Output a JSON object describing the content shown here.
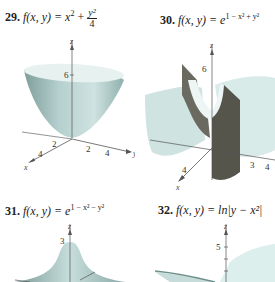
{
  "problems": [
    {
      "number": "29.",
      "lhs": "f(x, y) = ",
      "expr_main": "x",
      "expr_main_sup": "2",
      "expr_plus": " + ",
      "frac_num": "y²",
      "frac_den": "4",
      "axis": {
        "z": "z",
        "x": "x",
        "y": "y",
        "z_tick": "6",
        "x_ticks": [
          "2",
          "4"
        ],
        "y_ticks": [
          "2",
          "4"
        ]
      }
    },
    {
      "number": "30.",
      "lhs": "f(x, y) = e",
      "exponent": "1 − x² + y²",
      "axis": {
        "z": "z",
        "x": "x",
        "y": "y",
        "z_tick": "6",
        "x_ticks": [
          "4"
        ],
        "y_ticks": [
          "3",
          "4"
        ]
      }
    },
    {
      "number": "31.",
      "lhs": "f(x, y) = e",
      "exponent": "1 − x² − y²",
      "axis": {
        "z": "z",
        "z_tick": "3"
      }
    },
    {
      "number": "32.",
      "lhs": "f(x, y) = ln|y − x²|",
      "axis": {
        "z": "z",
        "z_tick": "5"
      }
    }
  ],
  "colors": {
    "surface_light": "#dfeeed",
    "surface_mid": "#a9c7c5",
    "surface_dark": "#6f8f8c",
    "shadow": "#4a4a44"
  }
}
